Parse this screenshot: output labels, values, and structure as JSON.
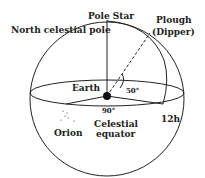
{
  "labels": {
    "pole_star": "Pole Star",
    "north_celestial_pole": "North celestial pole",
    "plough": "Plough",
    "dipper": "(Dipper)",
    "earth": "Earth",
    "angle_50": "50°",
    "angle_90": "90°",
    "twelve_h": "12h",
    "orion": "Orion",
    "celestial": "Celestial",
    "equator": "equator"
  },
  "colors": {
    "line": "#222222",
    "background": "#ffffff"
  }
}
